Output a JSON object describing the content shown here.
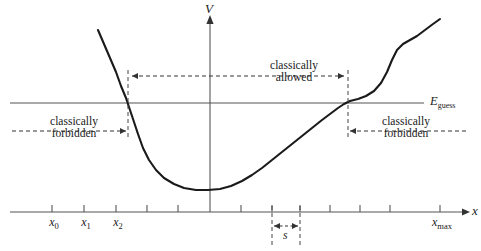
{
  "figure": {
    "name": "potential-well-classical-regions",
    "background": "#ffffff",
    "curve_color": "#1a1a1a",
    "axis_color": "#555555",
    "dash_color": "#444444"
  },
  "axes": {
    "vertical_label": "V",
    "horizontal_label": "x",
    "vertical_axis_x": 210,
    "horizontal_axis_y": 212,
    "tick_labels": [
      {
        "text": "x",
        "sub": "0",
        "x": 52
      },
      {
        "text": "x",
        "sub": "1",
        "x": 84
      },
      {
        "text": "x",
        "sub": "2",
        "x": 116
      },
      {
        "text": "x",
        "sub": "max",
        "x": 440
      }
    ],
    "tick_positions": [
      52,
      84,
      116,
      147,
      178,
      210,
      241,
      272,
      300,
      330,
      360,
      390,
      440,
      470
    ]
  },
  "energy": {
    "label": "E",
    "label_sub": "guess",
    "line_y": 103,
    "line_x_start": 10,
    "line_x_end": 424
  },
  "regions": [
    {
      "id": "classically-allowed",
      "line1": "classically",
      "line2": "allowed",
      "arrow_from": 128,
      "arrow_to": 348,
      "arrow_y": 76,
      "label_center_x": 294,
      "label_top": 59
    },
    {
      "id": "classically-forbidden-left",
      "line1": "classically",
      "line2": "forbidden",
      "arrow_from": 12,
      "arrow_to": 128,
      "arrow_y": 131,
      "label_center_x": 74,
      "label_top": 115
    },
    {
      "id": "classically-forbidden-right",
      "line1": "classically",
      "line2": "forbidden",
      "arrow_from": 466,
      "arrow_to": 348,
      "arrow_y": 131,
      "label_center_x": 406,
      "label_top": 115
    }
  ],
  "turning_points": {
    "left_x": 128,
    "right_x": 348,
    "dash_top": 70,
    "dash_bottom": 137
  },
  "step": {
    "label": "s",
    "left_x": 272,
    "right_x": 300,
    "arrow_y": 226,
    "dash_top": 206,
    "dash_bottom": 246,
    "label_x": 286,
    "label_y": 229
  },
  "curve": {
    "description": "potential energy V(x) well with steep left wall and S-shaped right wall",
    "points": "98,30 104,44 110,58 116,72 121,86 126,98 130,110 134,122 138,134 143,148 149,160 156,170 164,178 174,184 184,188 196,190 208,190 220,189 231,186 242,181 252,175 262,168 272,160 282,152 292,144 302,136 312,128 322,120 330,114 338,108 344,104 350,101 358,99 366,96 374,91 381,83 387,72 392,60 397,50 403,44 410,40 417,36 425,30 433,24 440,19"
  }
}
